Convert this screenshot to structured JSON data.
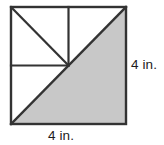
{
  "figure": {
    "name": "shaded-triangle-in-square",
    "colors": {
      "shaded_fill": "#c8c8c8",
      "unshaded_fill": "#ffffff",
      "stroke": "#333333",
      "label_text": "#1c1c1c"
    },
    "square": {
      "x": 11,
      "y": 7,
      "width": 115,
      "height": 117,
      "stroke_width": 2.4
    },
    "center_point": {
      "x": 68.5,
      "y": 65.5
    },
    "segments": [
      {
        "name": "main-diagonal",
        "x1": 11,
        "y1": 124,
        "x2": 126,
        "y2": 7,
        "stroke_width": 2.4
      },
      {
        "name": "center-vertical-segment",
        "x1": 68.5,
        "y1": 7,
        "x2": 68.5,
        "y2": 65.5,
        "stroke_width": 2.2
      },
      {
        "name": "center-horizontal-segment",
        "x1": 11,
        "y1": 65.5,
        "x2": 68.5,
        "y2": 65.5,
        "stroke_width": 2.2
      },
      {
        "name": "upper-left-quadrant-diagonal",
        "x1": 11,
        "y1": 7,
        "x2": 68.5,
        "y2": 65.5,
        "stroke_width": 2.2
      }
    ],
    "shaded_region": {
      "name": "shaded-lower-right-triangle",
      "points": "11,124 126,124 126,7"
    },
    "labels": {
      "right_side": "4 in.",
      "bottom_side": "4 in."
    }
  }
}
